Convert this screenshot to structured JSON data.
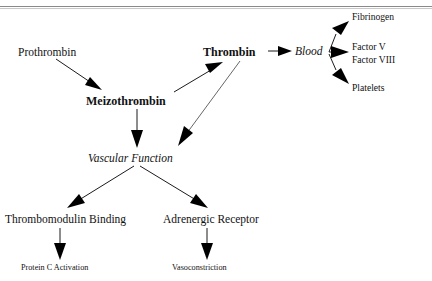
{
  "page": {
    "background_color": "#ffffff",
    "ink_color": "#111111",
    "rule_color": "#8a8a8a"
  },
  "diagram": {
    "type": "flowchart",
    "orientation": "top-down-left-right",
    "nodes": [
      {
        "id": "prothrombin",
        "label": "Prothrombin",
        "style": "regular",
        "x": 18,
        "y": 56
      },
      {
        "id": "meizothrombin",
        "label": "Meizothrombin",
        "style": "bold",
        "x": 86,
        "y": 105
      },
      {
        "id": "thrombin",
        "label": "Thrombin",
        "style": "bold",
        "x": 203,
        "y": 56
      },
      {
        "id": "blood",
        "label": "Blood",
        "style": "italic",
        "x": 295,
        "y": 55
      },
      {
        "id": "fibrinogen",
        "label": "Fibrinogen",
        "style": "small-right",
        "x": 352,
        "y": 20
      },
      {
        "id": "factor-v",
        "label": "Factor V",
        "style": "small-right",
        "x": 352,
        "y": 50
      },
      {
        "id": "factor-viii",
        "label": "Factor VIII",
        "style": "small-right",
        "x": 352,
        "y": 63
      },
      {
        "id": "platelets",
        "label": "Platelets",
        "style": "small-right",
        "x": 352,
        "y": 91
      },
      {
        "id": "vascular-function",
        "label": "Vascular  Function",
        "style": "italic",
        "x": 88,
        "y": 162
      },
      {
        "id": "thrombomodulin-binding",
        "label": "Thrombomodulin Binding",
        "style": "regular",
        "x": 5,
        "y": 223
      },
      {
        "id": "adrenergic-receptor",
        "label": "Adrenergic Receptor",
        "style": "regular",
        "x": 163,
        "y": 223
      },
      {
        "id": "protein-c-activation",
        "label": "Protein C Activation",
        "style": "small",
        "x": 21,
        "y": 270
      },
      {
        "id": "vasoconstriction",
        "label": "Vasoconstriction",
        "style": "small",
        "x": 172,
        "y": 270
      }
    ],
    "edges": [
      {
        "id": "e-prothrombin-meizothrombin",
        "from": "prothrombin",
        "to": "meizothrombin"
      },
      {
        "id": "e-meizothrombin-thrombin",
        "from": "meizothrombin",
        "to": "thrombin"
      },
      {
        "id": "e-thrombin-blood",
        "from": "thrombin",
        "to": "blood"
      },
      {
        "id": "e-blood-fibrinogen",
        "from": "blood",
        "to": "fibrinogen"
      },
      {
        "id": "e-blood-factor-v",
        "from": "blood",
        "to": "factor-v"
      },
      {
        "id": "e-blood-platelets",
        "from": "blood",
        "to": "platelets"
      },
      {
        "id": "e-meizothrombin-vascular",
        "from": "meizothrombin",
        "to": "vascular-function"
      },
      {
        "id": "e-thrombin-vascular",
        "from": "thrombin",
        "to": "vascular-function"
      },
      {
        "id": "e-vascular-thrombomodulin",
        "from": "vascular-function",
        "to": "thrombomodulin-binding"
      },
      {
        "id": "e-vascular-adrenergic",
        "from": "vascular-function",
        "to": "adrenergic-receptor"
      },
      {
        "id": "e-thrombomodulin-proteinc",
        "from": "thrombomodulin-binding",
        "to": "protein-c-activation"
      },
      {
        "id": "e-adrenergic-vasoconstriction",
        "from": "adrenergic-receptor",
        "to": "vasoconstriction"
      }
    ]
  }
}
